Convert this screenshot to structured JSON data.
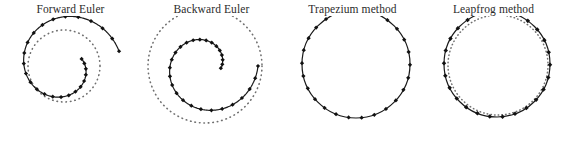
{
  "figure": {
    "background_color": "#ffffff",
    "curve_color": "#1a1a1a",
    "exact_color": "#6f6f6f",
    "marker_color": "#111111",
    "panel_count": 4
  },
  "panels": [
    {
      "id": "forward-euler",
      "title": "Forward Euler",
      "behavior": "outward-spiral",
      "has_exact_circle": true,
      "marker_count": 26
    },
    {
      "id": "backward-euler",
      "title": "Backward Euler",
      "behavior": "inward-spiral",
      "has_exact_circle": true,
      "marker_count": 28
    },
    {
      "id": "trapezium-method",
      "title": "Trapezium method",
      "behavior": "closed-circle",
      "has_exact_circle": false,
      "marker_count": 26
    },
    {
      "id": "leapfrog-method",
      "title": "Leapfrog method",
      "behavior": "closed-circle",
      "has_exact_circle": true,
      "marker_count": 26
    }
  ],
  "chart_data": {
    "type": "line",
    "title": "",
    "xlabel": "",
    "ylabel": "",
    "grid": false,
    "legend": "none",
    "subplots": [
      {
        "name": "Forward Euler",
        "center": [
          64,
          66
        ],
        "series": [
          {
            "name": "numerical trajectory",
            "style": "solid-with-square-markers",
            "kind": "spiral",
            "start_radius": 19.0,
            "end_radius": 57.0,
            "start_angle_deg": -22,
            "end_angle_deg": 345,
            "n_points": 26
          },
          {
            "name": "exact solution",
            "style": "dotted",
            "kind": "circle",
            "radius": 36.0
          }
        ]
      },
      {
        "name": "Backward Euler",
        "center": [
          205,
          66
        ],
        "series": [
          {
            "name": "numerical trajectory",
            "style": "solid-with-square-markers",
            "kind": "spiral",
            "start_radius": 53.0,
            "end_radius": 16.0,
            "start_angle_deg": 0,
            "end_angle_deg": 368,
            "n_points": 28
          },
          {
            "name": "exact solution",
            "style": "dotted",
            "kind": "circle",
            "radius": 57.0
          }
        ]
      },
      {
        "name": "Trapezium method",
        "center": [
          356,
          64
        ],
        "series": [
          {
            "name": "numerical trajectory",
            "style": "solid-with-square-markers",
            "kind": "circle",
            "radius": 54.0,
            "n_points": 26
          }
        ]
      },
      {
        "name": "Leapfrog method",
        "center": [
          497,
          64
        ],
        "series": [
          {
            "name": "numerical trajectory",
            "style": "solid-with-square-markers",
            "kind": "circle",
            "radius": 53.0,
            "n_points": 26
          },
          {
            "name": "exact solution",
            "style": "dotted",
            "kind": "circle",
            "radius": 50.0
          }
        ]
      }
    ]
  }
}
